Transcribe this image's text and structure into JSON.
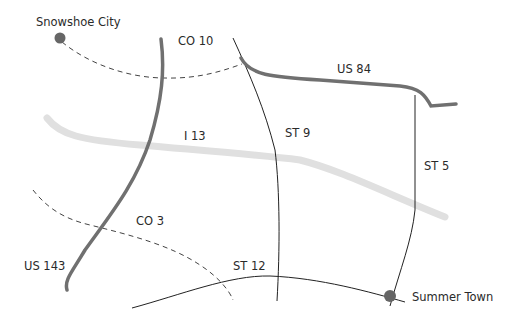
{
  "map": {
    "cities": [
      {
        "name": "Snowshoe City",
        "x": 60,
        "y": 38
      },
      {
        "name": "Summer Town",
        "x": 390,
        "y": 297
      }
    ],
    "roads": [
      {
        "name": "CO 10",
        "type": "county",
        "style": "dashed"
      },
      {
        "name": "US 84",
        "type": "us-highway",
        "style": "thick-dark"
      },
      {
        "name": "I 13",
        "type": "interstate",
        "style": "thick-light"
      },
      {
        "name": "ST 9",
        "type": "state",
        "style": "thin"
      },
      {
        "name": "ST 5",
        "type": "state",
        "style": "thin"
      },
      {
        "name": "CO 3",
        "type": "county",
        "style": "dashed"
      },
      {
        "name": "US 143",
        "type": "us-highway",
        "style": "thick-dark"
      },
      {
        "name": "ST 12",
        "type": "state",
        "style": "thin"
      }
    ],
    "colors": {
      "us_highway": "#707070",
      "interstate": "#e0e0e0",
      "state": "#222222",
      "county": "#444444",
      "city_dot": "#666666"
    }
  }
}
